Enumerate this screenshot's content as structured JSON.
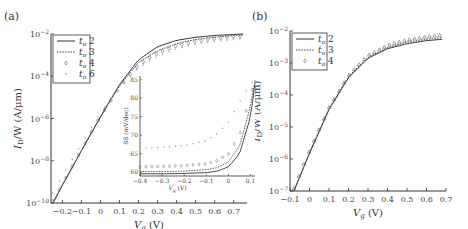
{
  "chart_data": [
    {
      "panel": "(a)",
      "type": "line",
      "title": "",
      "xlabel": "V_g (V)",
      "ylabel": "I_D/W (A/μm)",
      "yscale": "log",
      "xlim": [
        -0.26,
        0.77
      ],
      "ylim": [
        1e-10,
        0.01
      ],
      "xticks": [
        "-0.2",
        "-0.1",
        "0",
        "0.1",
        "0.2",
        "0.3",
        "0.4",
        "0.5",
        "0.6",
        "0.7"
      ],
      "yticks": [
        "10^-10",
        "10^-8",
        "10^-6",
        "10^-4",
        "10^-2"
      ],
      "legend": [
        "t_o 2",
        "t_o 3",
        "t_o 4",
        "t_o 6"
      ],
      "legend_position": "upper left",
      "x": [
        -0.25,
        -0.2,
        -0.1,
        0.0,
        0.1,
        0.2,
        0.3,
        0.4,
        0.5,
        0.6,
        0.7,
        0.75
      ],
      "series": [
        {
          "name": "t_o 2",
          "style": "solid",
          "values": [
            1e-10,
            7e-10,
            3e-08,
            1.2e-06,
            4e-05,
            0.0006,
            0.0025,
            0.005,
            0.007,
            0.0085,
            0.0095,
            0.01
          ]
        },
        {
          "name": "t_o 3",
          "style": "dotted",
          "values": [
            1e-10,
            7e-10,
            3e-08,
            1.2e-06,
            3.5e-05,
            0.00045,
            0.0016,
            0.0035,
            0.0055,
            0.007,
            0.0085,
            0.009
          ]
        },
        {
          "name": "t_o 4",
          "style": "diamond",
          "values": [
            1.2e-10,
            8e-10,
            3.2e-08,
            1.3e-06,
            3e-05,
            0.00035,
            0.0013,
            0.0028,
            0.0045,
            0.006,
            0.0075,
            0.008
          ]
        },
        {
          "name": "t_o 6",
          "style": "plus",
          "values": [
            3e-10,
            2e-09,
            6e-08,
            2e-06,
            3e-05,
            0.00025,
            0.0009,
            0.002,
            0.0033,
            0.0045,
            0.0055,
            0.006
          ]
        }
      ],
      "inset": {
        "type": "line",
        "xlabel": "V_g (V)",
        "ylabel": "SS (mV/dec)",
        "xlim": [
          -0.4,
          0.12
        ],
        "ylim": [
          59,
          86
        ],
        "xticks": [
          "-0.4",
          "-0.3",
          "-0.2",
          "-0.1",
          "0",
          "0.1"
        ],
        "yticks": [
          "60",
          "65",
          "70",
          "75",
          "80",
          "85"
        ],
        "x": [
          -0.4,
          -0.3,
          -0.2,
          -0.1,
          -0.05,
          0.0,
          0.05,
          0.1,
          0.12
        ],
        "series": [
          {
            "name": "t_o 2",
            "values": [
              59.6,
              59.6,
              59.7,
              59.9,
              60.3,
              61.5,
              65,
              75,
              84
            ]
          },
          {
            "name": "t_o 3",
            "values": [
              60.2,
              60.2,
              60.3,
              60.7,
              61.3,
              62.8,
              67,
              78,
              85
            ]
          },
          {
            "name": "t_o 4",
            "values": [
              61.5,
              61.6,
              61.8,
              62.3,
              63.2,
              65,
              70,
              81,
              85
            ]
          },
          {
            "name": "t_o 6",
            "values": [
              66.5,
              66.7,
              67.2,
              68.5,
              70.5,
              73.5,
              79,
              84,
              85
            ]
          }
        ]
      }
    },
    {
      "panel": "(b)",
      "type": "line",
      "title": "",
      "xlabel": "V_g (V)",
      "ylabel": "I_D/W (A/μm)",
      "yscale": "log",
      "xlim": [
        -0.1,
        0.7
      ],
      "ylim": [
        1e-07,
        0.01
      ],
      "xticks": [
        "-0.1",
        "0",
        "0.1",
        "0.2",
        "0.3",
        "0.4",
        "0.5",
        "0.6",
        "0.7"
      ],
      "yticks": [
        "10^-7",
        "10^-6",
        "10^-5",
        "10^-4",
        "10^-3",
        "10^-2"
      ],
      "legend": [
        "t_o 2",
        "t_o 3",
        "t_o 4"
      ],
      "legend_position": "upper left",
      "x": [
        -0.08,
        0.0,
        0.1,
        0.2,
        0.3,
        0.4,
        0.5,
        0.6,
        0.68
      ],
      "series": [
        {
          "name": "t_o 2",
          "style": "solid",
          "values": [
            1e-07,
            1.5e-06,
            3.5e-05,
            0.00035,
            0.0014,
            0.0028,
            0.004,
            0.005,
            0.0055
          ]
        },
        {
          "name": "t_o 3",
          "style": "dotted",
          "values": [
            1e-07,
            1.6e-06,
            3.7e-05,
            0.00038,
            0.0015,
            0.003,
            0.0045,
            0.0055,
            0.0062
          ]
        },
        {
          "name": "t_o 4",
          "style": "triangle",
          "values": [
            1.2e-07,
            1.8e-06,
            4e-05,
            0.0004,
            0.0017,
            0.0035,
            0.0052,
            0.0065,
            0.0075
          ]
        }
      ]
    }
  ],
  "labels": {
    "panel_a": "(a)",
    "panel_b": "(b)",
    "xlabel_main": "V",
    "xlabel_sub": "g",
    "xlabel_unit": " (V)",
    "ylabel_main": "I",
    "ylabel_sub": "D",
    "ylabel_rest": "/W (A/μm)",
    "inset_ylabel": "SS (mV/dec)",
    "inset_xlabel": "V",
    "inset_xlabel_sub": "g",
    "inset_xlabel_unit": " (V)",
    "legend_a": [
      {
        "sym": "t",
        "sub": "o",
        "val": " 2"
      },
      {
        "sym": "t",
        "sub": "o",
        "val": " 3"
      },
      {
        "sym": "t",
        "sub": "o",
        "val": " 4"
      },
      {
        "sym": "t",
        "sub": "o",
        "val": " 6"
      }
    ],
    "legend_b": [
      {
        "sym": "t",
        "sub": "o",
        "val": " 2"
      },
      {
        "sym": "t",
        "sub": "o",
        "val": " 3"
      },
      {
        "sym": "t",
        "sub": "o",
        "val": " 4"
      }
    ]
  },
  "colors": {
    "axis": "#333333",
    "t2": "#333333",
    "t3": "#444444",
    "t4": "#666666",
    "t6": "#aaaaaa"
  }
}
